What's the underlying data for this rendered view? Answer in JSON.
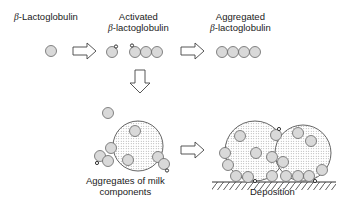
{
  "labels": {
    "native": {
      "greek": "β",
      "text": "-Lactoglobulin"
    },
    "activated": {
      "line1": "Activated",
      "greek": "β",
      "text": "-lactoglobulin"
    },
    "aggregated": {
      "line1": "Aggregated",
      "greek": "β",
      "text": "-lactoglobulin"
    },
    "milk_aggregates": {
      "line1": "Aggregates of milk",
      "line2": "components"
    },
    "deposition": {
      "text": "Deposition"
    }
  },
  "colors": {
    "protein_fill": "#d9d9d9",
    "aggregate_fill": "#e4e4e4",
    "stroke": "#555555",
    "arrow_stroke": "#444444"
  }
}
